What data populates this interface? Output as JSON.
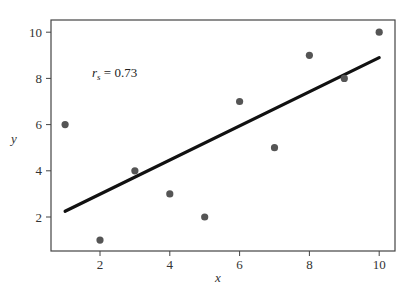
{
  "chart_data": {
    "type": "scatter",
    "title": "",
    "xlabel": "x",
    "ylabel": "y",
    "xlim": [
      0.6,
      10.4
    ],
    "ylim": [
      0.4,
      10.4
    ],
    "xticks": [
      2,
      4,
      6,
      8,
      10
    ],
    "yticks": [
      2,
      4,
      6,
      8,
      10
    ],
    "grid": false,
    "legend": null,
    "series": [
      {
        "name": "data points",
        "type": "scatter",
        "color": "#555555",
        "x": [
          1,
          2,
          3,
          4,
          5,
          6,
          7,
          8,
          9,
          10
        ],
        "y": [
          6,
          1,
          4,
          3,
          2,
          7,
          5,
          9,
          8,
          10
        ]
      },
      {
        "name": "fit line",
        "type": "line",
        "color": "#111111",
        "x": [
          1,
          10
        ],
        "y": [
          2.25,
          8.9
        ]
      }
    ],
    "annotations": [
      {
        "text_main": "r",
        "text_sub": "s",
        "text_rest": " = 0.73",
        "x": 2.1,
        "y": 8.0
      }
    ]
  },
  "labels": {
    "xticks": [
      "2",
      "4",
      "6",
      "8",
      "10"
    ],
    "yticks": [
      "2",
      "4",
      "6",
      "8",
      "10"
    ],
    "xlabel": "x",
    "ylabel": "y",
    "annot_main": "r",
    "annot_sub": "s",
    "annot_rest": " = 0.73"
  }
}
